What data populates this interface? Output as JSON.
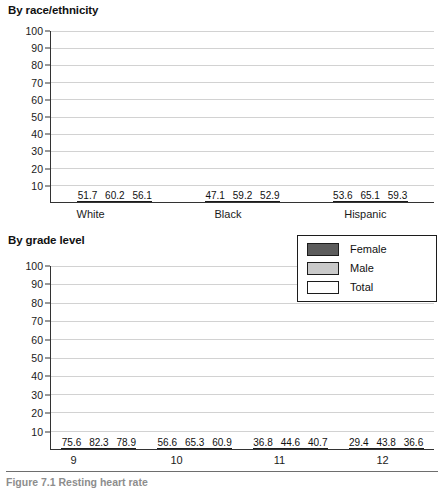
{
  "figure": {
    "series_colors": {
      "female": "#5c5c5c",
      "male": "#c9c9c9",
      "total": "#ffffff",
      "outline": "#1c1c1c",
      "gridline": "#d2d2d2",
      "axis": "#333333"
    },
    "legend": {
      "items": [
        {
          "label": "Female",
          "key": "female"
        },
        {
          "label": "Male",
          "key": "male"
        },
        {
          "label": "Total",
          "key": "total"
        }
      ]
    },
    "footer_caption": "Figure 7.1  Resting heart rate"
  },
  "chart_data": [
    {
      "type": "bar",
      "title": "By race/ethnicity",
      "categories": [
        "White",
        "Black",
        "Hispanic"
      ],
      "series": [
        {
          "name": "Female",
          "values": [
            51.7,
            47.1,
            53.6
          ]
        },
        {
          "name": "Male",
          "values": [
            60.2,
            59.2,
            65.1
          ]
        },
        {
          "name": "Total",
          "values": [
            56.1,
            52.9,
            59.3
          ]
        }
      ],
      "xlabel": "",
      "ylabel": "",
      "ylim": [
        0,
        100
      ],
      "yticks": [
        0,
        10,
        20,
        30,
        40,
        50,
        60,
        70,
        80,
        90,
        100
      ],
      "ytick_labels": [
        "",
        "10",
        "20",
        "30",
        "40",
        "50",
        "60",
        "70",
        "80",
        "90",
        "100"
      ],
      "grid": true,
      "legend_position": "none"
    },
    {
      "type": "bar",
      "title": "By grade level",
      "categories": [
        "9",
        "10",
        "11",
        "12"
      ],
      "series": [
        {
          "name": "Female",
          "values": [
            75.6,
            56.6,
            36.8,
            29.4
          ]
        },
        {
          "name": "Male",
          "values": [
            82.3,
            65.3,
            44.6,
            43.8
          ]
        },
        {
          "name": "Total",
          "values": [
            78.9,
            60.9,
            40.7,
            36.6
          ]
        }
      ],
      "xlabel": "",
      "ylabel": "",
      "ylim": [
        0,
        100
      ],
      "yticks": [
        0,
        10,
        20,
        30,
        40,
        50,
        60,
        70,
        80,
        90,
        100
      ],
      "ytick_labels": [
        "",
        "10",
        "20",
        "30",
        "40",
        "50",
        "60",
        "70",
        "80",
        "90",
        "100"
      ],
      "grid": true,
      "legend_position": "upper-right"
    }
  ]
}
